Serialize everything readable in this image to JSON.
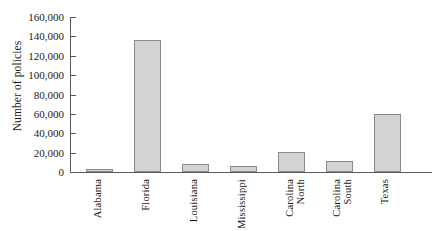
{
  "chart_data": {
    "type": "bar",
    "title": "",
    "xlabel": "",
    "ylabel": "Number of policies",
    "categories": [
      "Alabama",
      "Florida",
      "Louisiana",
      "Mississippi",
      "North Carolina",
      "South Carolina",
      "Texas"
    ],
    "values": [
      3000,
      136000,
      8000,
      6500,
      21000,
      11000,
      60000
    ],
    "ylim": [
      0,
      160000
    ],
    "ytick_values": [
      0,
      20000,
      40000,
      60000,
      80000,
      100000,
      120000,
      140000,
      160000
    ],
    "ytick_labels": [
      "0",
      "20,000",
      "40,000",
      "60,000",
      "80,000",
      "100,000",
      "120,000",
      "140,000",
      "160,000"
    ],
    "grid": false,
    "legend": null,
    "bar_color": "#d3d3d3",
    "bar_edge_color": "#8a8a8a",
    "axis_color": "#5a5a5a"
  }
}
